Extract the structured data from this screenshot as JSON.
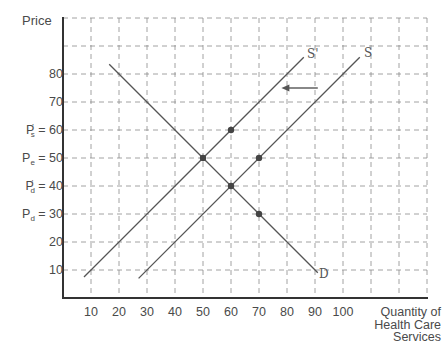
{
  "chart_data": {
    "type": "line",
    "title": "",
    "xlabel": "Quantity of Health Care Services",
    "ylabel": "Price",
    "xlim": [
      0,
      130
    ],
    "ylim": [
      0,
      100
    ],
    "grid": true,
    "x_ticks": [
      10,
      20,
      30,
      40,
      50,
      60,
      70,
      80,
      90,
      100
    ],
    "x_tick_labels": [
      "10",
      "20",
      "30",
      "40",
      "50",
      "60",
      "70",
      "80",
      "90",
      "100"
    ],
    "y_ticks": [
      10,
      20,
      30,
      40,
      50,
      60,
      70,
      80
    ],
    "y_tick_labels": [
      {
        "value": 80,
        "main": "80",
        "sub": "",
        "sup": ""
      },
      {
        "value": 70,
        "main": "70",
        "sub": "",
        "sup": ""
      },
      {
        "value": 60,
        "main": "P",
        "sub": "s",
        "sup": "'",
        "rhs": "= 60"
      },
      {
        "value": 50,
        "main": "P",
        "sub": "e",
        "sup": "",
        "rhs": "= 50"
      },
      {
        "value": 40,
        "main": "P",
        "sub": "d",
        "sup": "'",
        "rhs": "= 40"
      },
      {
        "value": 30,
        "main": "P",
        "sub": "d",
        "sup": "",
        "rhs": "= 30"
      },
      {
        "value": 20,
        "main": "20",
        "sub": "",
        "sup": ""
      },
      {
        "value": 10,
        "main": "10",
        "sub": "",
        "sup": ""
      }
    ],
    "series": [
      {
        "name": "S'",
        "points": [
          [
            7.5,
            7.5
          ],
          [
            86,
            86
          ]
        ],
        "color": "#555555"
      },
      {
        "name": "S",
        "points": [
          [
            27,
            7
          ],
          [
            106,
            86
          ]
        ],
        "color": "#555555"
      },
      {
        "name": "D",
        "points": [
          [
            16.5,
            83.5
          ],
          [
            91,
            9
          ]
        ],
        "color": "#555555"
      }
    ],
    "marked_points": [
      [
        60,
        60
      ],
      [
        50,
        50
      ],
      [
        70,
        50
      ],
      [
        60,
        40
      ],
      [
        70,
        30
      ]
    ],
    "annotations": [
      {
        "type": "arrow",
        "from": [
          91,
          75
        ],
        "to": [
          78,
          75
        ],
        "direction": "left",
        "meaning": "supply shifts left from S to S'"
      }
    ],
    "legend": "none (curves labeled inline)"
  },
  "axis": {
    "y_title": "Price",
    "x_title_lines": [
      "Quantity of",
      "Health Care",
      "Services"
    ]
  },
  "curve_labels": {
    "s_prime": "S'",
    "s": "S",
    "d": "D"
  }
}
